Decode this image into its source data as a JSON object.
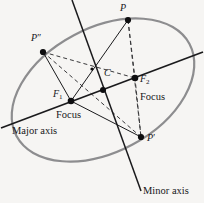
{
  "figure": {
    "background_color": "#f6f5f3",
    "ellipse_color": "#8d8d8f",
    "line_color": "#1a1a1c",
    "dash_color": "#3a3a3c",
    "point_color": "#0e0e10"
  },
  "labels": {
    "p": "P",
    "p_prime": "P′",
    "p_double_prime": "P″",
    "f1": "F",
    "f1_sub": "1",
    "f2": "F",
    "f2_sub": "2",
    "center": "C",
    "focus_left": "Focus",
    "focus_right": "Focus",
    "major_axis": "Major axis",
    "minor_axis": "Minor axis"
  },
  "geometry": {
    "ellipse": {
      "cx": 103,
      "cy": 90,
      "rx": 98,
      "ry": 62,
      "rotation_deg": -28
    },
    "points": {
      "P": [
        128,
        20
      ],
      "P_prime": [
        141,
        137
      ],
      "P_double_prime": [
        43,
        52
      ],
      "F1": [
        71,
        101
      ],
      "F2": [
        135,
        78
      ],
      "C": [
        103,
        90
      ],
      "X": [
        92,
        69
      ]
    },
    "major_axis_endpoints": [
      [
        1,
        128
      ],
      [
        203,
        52
      ]
    ],
    "minor_axis_endpoints": [
      [
        72,
        0
      ],
      [
        141,
        191
      ]
    ],
    "solid_segments": [
      [
        "P_double_prime",
        "F1"
      ],
      [
        "P",
        "F1"
      ],
      [
        "F1",
        "P_prime"
      ]
    ],
    "dashed_segments": [
      [
        "P_double_prime",
        "F2"
      ],
      [
        "P",
        "F2"
      ],
      [
        "P_prime",
        "F2"
      ],
      [
        "P",
        "P_prime"
      ],
      [
        "P_double_prime",
        "P_prime"
      ]
    ]
  }
}
